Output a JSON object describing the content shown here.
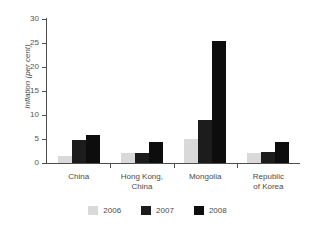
{
  "chart_data": {
    "type": "bar",
    "title": "",
    "subtitle": "",
    "xlabel": "",
    "ylabel": "Inflation (per cent)",
    "ylim": [
      0,
      30
    ],
    "yticks": [
      0,
      5,
      10,
      15,
      20,
      25,
      30
    ],
    "ytick_labels": [
      "0",
      "5",
      "10",
      "15",
      "20",
      "25",
      "30"
    ],
    "grid": false,
    "legend_position": "bottom",
    "categories": [
      "China",
      "Hong Kong,\nChina",
      "Mongolia",
      "Republic\nof Korea"
    ],
    "series": [
      {
        "name": "2006",
        "color": "#d9d9d9",
        "values": [
          1.5,
          2.0,
          5.0,
          2.0
        ]
      },
      {
        "name": "2007",
        "color": "#1c1c1c",
        "values": [
          4.8,
          2.0,
          9.0,
          2.3
        ]
      },
      {
        "name": "2008",
        "color": "#0d0d0d",
        "values": [
          5.9,
          4.3,
          25.4,
          4.4
        ]
      }
    ]
  },
  "legend": {
    "items": [
      {
        "label": "2006",
        "color": "#d9d9d9"
      },
      {
        "label": "2007",
        "color": "#1c1c1c"
      },
      {
        "label": "2008",
        "color": "#0d0d0d"
      }
    ]
  },
  "axes": {
    "y_title": "Inflation (per cent)"
  }
}
